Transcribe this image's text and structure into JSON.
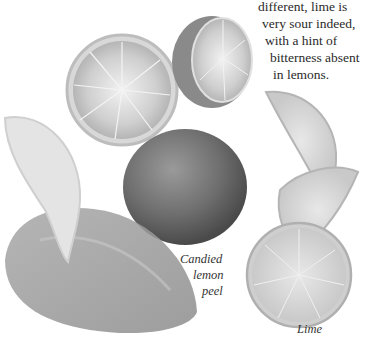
{
  "article": {
    "text_lines": [
      "different, lime is",
      "very sour indeed,",
      "with a hint of",
      "bitterness absent",
      "in lemons."
    ]
  },
  "captions": {
    "candied_peel": [
      "Candied",
      "lemon",
      "peel"
    ],
    "lime": "Lime"
  },
  "illustration": {
    "items": [
      "lime-half-cut",
      "lime-half-side",
      "whole-lemon",
      "lemon-wedge",
      "candied-lemon-peel",
      "lime-wedge-upper",
      "lime-wedge-lower",
      "lime-slice"
    ],
    "tone": "grayscale"
  }
}
